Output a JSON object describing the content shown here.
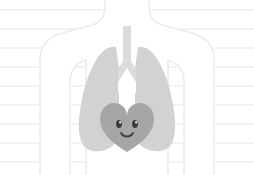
{
  "illustration": {
    "title": "Anatomical torso with lungs and smiling heart",
    "subject": "human chest anatomy",
    "style": "flat vector clip art",
    "canvas": {
      "width": 254,
      "height": 175,
      "background_color": "#ffffff"
    },
    "background": {
      "name": "ruled-paper-lines",
      "line_color": "#f2f2f2",
      "line_count": 9,
      "line_spacing_px": 19,
      "first_line_y": 9,
      "line_thickness_px": 2
    },
    "body_outline": {
      "label": "Torso silhouette",
      "stroke_color": "#ebebeb",
      "fill_color": "#ffffff",
      "stroke_width_px": 1.6
    },
    "lungs": {
      "label": "Lungs",
      "fill_color": "#d2d2d2",
      "left_lobe_label": "Right lung",
      "right_lobe_label": "Left lung"
    },
    "airway": {
      "label": "Trachea and bronchi",
      "fill_color": "#dcdcdc",
      "trachea_label": "Trachea",
      "bronchi_label": "Bronchi"
    },
    "heart": {
      "label": "Heart",
      "fill_color": "#a6a6a6",
      "expression": "smiling",
      "face": {
        "eye_color": "#3b3b3b",
        "eye_highlight_color": "#f2f2f2",
        "mouth_color": "#3b3b3b",
        "eye_count": 2
      }
    }
  }
}
